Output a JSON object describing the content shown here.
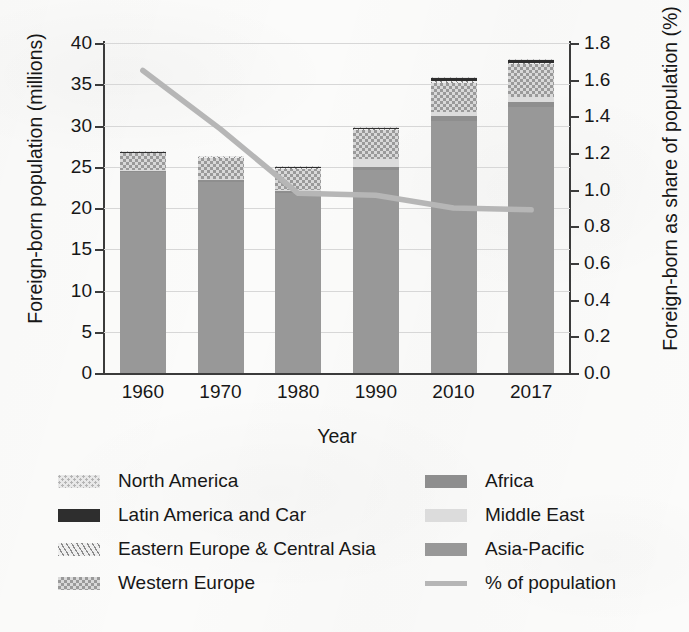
{
  "chart_data": {
    "type": "bar",
    "subtype": "stacked-bar-with-line-overlay",
    "title": "",
    "xlabel": "Year",
    "ylabel": "Foreign-born population (millions)",
    "y2label": "Foreign-born as share of population (%)",
    "categories": [
      "1960",
      "1970",
      "1980",
      "1990",
      "2010",
      "2017"
    ],
    "ylim": [
      0,
      40
    ],
    "yticks": [
      "0",
      "5",
      "10",
      "15",
      "20",
      "25",
      "30",
      "35",
      "40"
    ],
    "y2lim": [
      0.0,
      1.8
    ],
    "y2ticks": [
      "0.0",
      "0.2",
      "0.4",
      "0.6",
      "0.8",
      "1.0",
      "1.2",
      "1.4",
      "1.6",
      "1.8"
    ],
    "grid": true,
    "legend_position": "below-plot-two-columns",
    "series": [
      {
        "name": "Asia-Pacific",
        "pattern": "solid-medium-gray",
        "color": "#989898",
        "values": [
          24.4,
          23.2,
          21.8,
          24.6,
          30.6,
          32.3
        ]
      },
      {
        "name": "Africa",
        "pattern": "solid-gray",
        "color": "#8e8e8e",
        "values": [
          0.15,
          0.2,
          0.25,
          0.4,
          0.5,
          0.5
        ]
      },
      {
        "name": "Middle East",
        "pattern": "solid-light-gray",
        "color": "#dcdcdc",
        "values": [
          0.1,
          0.1,
          0.15,
          0.9,
          0.5,
          0.6
        ]
      },
      {
        "name": "Western Europe",
        "pattern": "checkerboard",
        "color": "#d9d9d9",
        "values": [
          2.0,
          2.6,
          2.6,
          3.5,
          3.6,
          4.0
        ]
      },
      {
        "name": "Eastern Europe & Central Asia",
        "pattern": "diagonal-hatch",
        "color": "#efefef",
        "values": [
          0.1,
          0.1,
          0.1,
          0.15,
          0.2,
          0.2
        ]
      },
      {
        "name": "Latin America and Car",
        "pattern": "solid-dark",
        "color": "#2e2e2e",
        "values": [
          0.05,
          0.05,
          0.1,
          0.25,
          0.4,
          0.4
        ]
      },
      {
        "name": "North America",
        "pattern": "dotted",
        "color": "#e8e8e8",
        "values": [
          0.05,
          0.05,
          0.05,
          0.05,
          0.05,
          0.05
        ]
      }
    ],
    "totals": [
      26.85,
      26.25,
      24.95,
      29.85,
      35.75,
      38.05
    ],
    "line_series": {
      "name": "% of population",
      "color": "#b6b6b6",
      "axis": "right",
      "values": [
        1.65,
        1.33,
        0.98,
        0.97,
        0.9,
        0.89
      ]
    }
  },
  "axes": {
    "left_title": "Foreign-born population (millions)",
    "right_title": "Foreign-born as share of population (%)",
    "x_title": "Year",
    "y_ticks": [
      "40",
      "35",
      "30",
      "25",
      "20",
      "15",
      "10",
      "5",
      "0"
    ],
    "y2_ticks": [
      "1.8",
      "1.6",
      "1.4",
      "1.2",
      "1.0",
      "0.8",
      "0.6",
      "0.4",
      "0.2",
      "0.0"
    ],
    "x_ticks": [
      "1960",
      "1970",
      "1980",
      "1990",
      "2010",
      "2017"
    ]
  },
  "legend": {
    "column_1": [
      {
        "label": "North America",
        "swatch": "dotted-swatch"
      },
      {
        "label": "Latin America and Car",
        "swatch": "solid-dark-swatch"
      },
      {
        "label": "Eastern Europe & Central Asia",
        "swatch": "diagonal-hatch-swatch"
      },
      {
        "label": "Western Europe",
        "swatch": "checkerboard-swatch"
      }
    ],
    "column_2": [
      {
        "label": "Africa",
        "swatch": "solid-gray-swatch"
      },
      {
        "label": "Middle East",
        "swatch": "solid-light-gray-swatch"
      },
      {
        "label": "Asia-Pacific",
        "swatch": "solid-medium-gray-swatch"
      },
      {
        "label": "% of population",
        "swatch": "line-swatch"
      }
    ]
  },
  "colors": {
    "asia_pacific": "#989898",
    "africa": "#8e8e8e",
    "middle_east": "#dcdcdc",
    "western_europe": "#d9d9d9",
    "eastern_europe": "#efefef",
    "latin_america": "#2e2e2e",
    "north_america": "#e8e8e8",
    "line": "#b6b6b6",
    "grid": "#d7d7d7",
    "axis": "#3b3b3b",
    "background": "#fbfbfa"
  }
}
